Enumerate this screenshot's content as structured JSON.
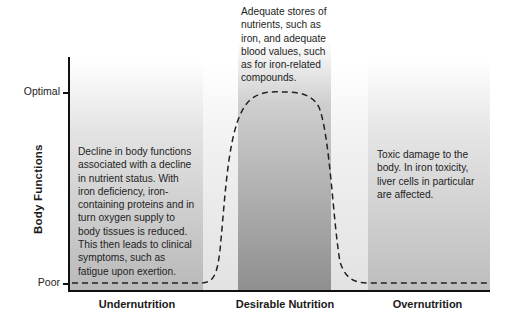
{
  "y_axis": {
    "title": "Body Functions",
    "ticks": [
      {
        "label": "Optimal"
      },
      {
        "label": "Poor"
      }
    ]
  },
  "x_axis": {
    "regions": [
      {
        "label": "Undernutrition"
      },
      {
        "label": "Desirable Nutrition"
      },
      {
        "label": "Overnutrition"
      }
    ]
  },
  "annotations": {
    "undernutrition": "Decline in body functions associated with a decline in nutrient status. With iron deficiency, iron-containing proteins and in turn oxygen supply to body tissues is reduced. This then leads to clinical symptoms, such as fatigue upon exertion.",
    "desirable": "Adequate stores of nutrients, such as iron, and adequate blood values, such as for iron-related compounds.",
    "overnutrition": "Toxic damage to the body. In iron toxicity, liver cells in particular are affected."
  },
  "curve": {
    "style": "dashed",
    "color": "#222222",
    "description": "Body function is poor during undernutrition, rises to optimal in the desirable nutrition range, and falls back to poor in overnutrition"
  },
  "colors": {
    "axis": "#111111",
    "panel_light": "#bdbdbd",
    "panel_dark": "#8f8f8f"
  }
}
